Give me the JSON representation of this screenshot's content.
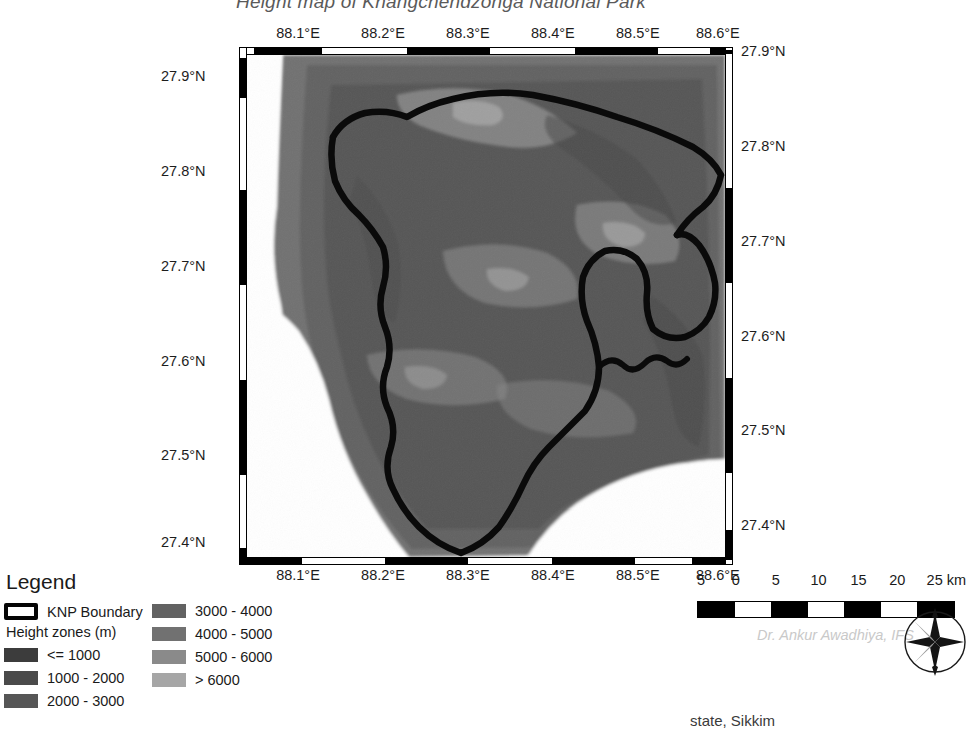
{
  "title": "Height map of Khangchendzonga National Park",
  "footer_note": "state, Sikkim",
  "map": {
    "x_axis": {
      "labels": [
        "88.1°E",
        "88.2°E",
        "88.3°E",
        "88.4°E",
        "88.5°E",
        "88.6°E"
      ],
      "positions_pct": [
        14.2,
        31.4,
        48.6,
        65.8,
        83.0,
        99.2
      ]
    },
    "y_axis_left": {
      "labels": [
        "27.9°N",
        "27.8°N",
        "27.7°N",
        "27.6°N",
        "27.5°N",
        "27.4°N"
      ],
      "positions_pct": [
        9.5,
        27.8,
        46.1,
        64.4,
        82.7,
        99.5
      ]
    },
    "y_axis_right": {
      "labels": [
        "27.9°N",
        "27.8°N",
        "27.7°N",
        "27.6°N",
        "27.5°N",
        "27.4°N"
      ],
      "positions_pct": [
        0.8,
        19.1,
        37.4,
        55.7,
        74.0,
        92.3
      ]
    }
  },
  "legend": {
    "heading": "Legend",
    "boundary_label": "KNP Boundary",
    "zones_heading": "Height zones (m)",
    "zones": [
      {
        "label": "<= 1000",
        "color": "#3c3c3c"
      },
      {
        "label": "1000 - 2000",
        "color": "#4a4a4a"
      },
      {
        "label": "2000 - 3000",
        "color": "#565656"
      },
      {
        "label": "3000 - 4000",
        "color": "#626262"
      },
      {
        "label": "4000 - 5000",
        "color": "#717171"
      },
      {
        "label": "5000 - 6000",
        "color": "#8a8a8a"
      },
      {
        "label": "> 6000",
        "color": "#a6a6a6"
      }
    ]
  },
  "scalebar": {
    "labels": [
      "5",
      "0",
      "5",
      "10",
      "15",
      "20",
      "25 km"
    ],
    "positions_pct": [
      0,
      13.5,
      29,
      44,
      59.5,
      74.5,
      89
    ],
    "segments": [
      "#000000",
      "#ffffff",
      "#000000",
      "#ffffff",
      "#000000",
      "#ffffff",
      "#000000"
    ]
  },
  "attribution": "Dr. Ankur Awadhiya, IFS",
  "icons": {
    "compass": "compass-rose-icon"
  },
  "chart_data": {
    "type": "heatmap",
    "title": "Height map of Khangchendzonga National Park",
    "xlabel": "Longitude",
    "ylabel": "Latitude",
    "xlim": [
      88.05,
      88.62
    ],
    "ylim": [
      27.38,
      27.92
    ],
    "x_ticks": [
      88.1,
      88.2,
      88.3,
      88.4,
      88.5,
      88.6
    ],
    "y_ticks": [
      27.4,
      27.5,
      27.6,
      27.7,
      27.8,
      27.9
    ],
    "grid": false,
    "legend_position": "bottom-left",
    "colorbar_label": "Height zones (m)",
    "classes": [
      {
        "range": "<= 1000",
        "min": 0,
        "max": 1000,
        "color": "#3c3c3c"
      },
      {
        "range": "1000 - 2000",
        "min": 1000,
        "max": 2000,
        "color": "#4a4a4a"
      },
      {
        "range": "2000 - 3000",
        "min": 2000,
        "max": 3000,
        "color": "#565656"
      },
      {
        "range": "3000 - 4000",
        "min": 3000,
        "max": 4000,
        "color": "#626262"
      },
      {
        "range": "4000 - 5000",
        "min": 4000,
        "max": 5000,
        "color": "#717171"
      },
      {
        "range": "5000 - 6000",
        "min": 5000,
        "max": 6000,
        "color": "#8a8a8a"
      },
      {
        "range": "> 6000",
        "min": 6000,
        "max": 8600,
        "color": "#a6a6a6"
      }
    ],
    "overlays": [
      {
        "name": "KNP Boundary",
        "type": "polygon-outline",
        "color": "#000000",
        "width_px": 6
      }
    ],
    "scalebar_km": [
      0,
      5,
      10,
      15,
      20,
      25
    ],
    "no_data_color": "#ffffff"
  }
}
